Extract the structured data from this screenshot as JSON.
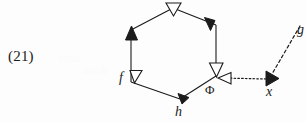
{
  "page": {
    "width": 306,
    "height": 122,
    "background_color": "#fdfdfd",
    "ink_color": "#1b1b1b"
  },
  "equation_number": {
    "text": "(21)"
  },
  "diagram": {
    "type": "commutative-hexagon-diagram",
    "nodes": [
      {
        "id": "f",
        "label": "f",
        "x": 131,
        "y": 82,
        "label_style": "italic"
      },
      {
        "id": "phi",
        "label": "Φ",
        "x": 216,
        "y": 76,
        "label_style": "upright"
      },
      {
        "id": "h",
        "label": "h",
        "x": 180,
        "y": 100,
        "label_style": "italic"
      },
      {
        "id": "x",
        "label": "x",
        "x": 272,
        "y": 80,
        "label_style": "italic"
      },
      {
        "id": "g",
        "label": "g",
        "x": 302,
        "y": 28,
        "label_style": "italic"
      }
    ],
    "hexagon_vertices": [
      {
        "name": "top",
        "x": 173,
        "y": 8
      },
      {
        "name": "upper-right",
        "x": 216,
        "y": 25
      },
      {
        "name": "lower-right",
        "x": 216,
        "y": 76
      },
      {
        "name": "bottom",
        "x": 180,
        "y": 99
      },
      {
        "name": "lower-left",
        "x": 131,
        "y": 82
      },
      {
        "name": "upper-left",
        "x": 131,
        "y": 30
      }
    ],
    "edges": [
      {
        "id": "edge-upperleft-top",
        "from": "upper-left",
        "to": "top",
        "line": "solid",
        "arrowhead": "hollow",
        "arrow_at": "to"
      },
      {
        "id": "edge-top-upperright",
        "from": "top",
        "to": "upper-right",
        "line": "solid",
        "arrowhead": "filled",
        "arrow_at": "to"
      },
      {
        "id": "edge-upperright-lowerright",
        "from": "upper-right",
        "to": "lower-right",
        "line": "solid",
        "arrowhead": "hollow",
        "arrow_at": "to"
      },
      {
        "id": "edge-bottom-lowerright",
        "from": "bottom",
        "to": "lower-right",
        "line": "solid",
        "arrowhead": "none",
        "arrow_at": "none"
      },
      {
        "id": "edge-lowerleft-bottom",
        "from": "lower-left",
        "to": "bottom",
        "line": "solid",
        "arrowhead": "filled",
        "arrow_at": "to"
      },
      {
        "id": "edge-lowerleft-upperleft",
        "from": "lower-left",
        "to": "upper-left",
        "line": "solid",
        "arrowhead": "filled",
        "arrow_at": "to"
      },
      {
        "id": "edge-f-marker",
        "from": "lower-left",
        "to": "lower-left",
        "line": "none",
        "arrowhead": "hollow",
        "arrow_at": "at-node"
      },
      {
        "id": "edge-x-to-phi",
        "from": "x",
        "to": "phi",
        "line": "dotted",
        "arrowhead": "hollow",
        "arrow_at": "to"
      },
      {
        "id": "edge-g-to-x",
        "from": "g",
        "to": "x",
        "line": "dashed",
        "arrowhead": "filled",
        "arrow_at": "to"
      }
    ],
    "arrowhead_styles": {
      "hollow": {
        "fill": "#ffffff",
        "stroke": "#1b1b1b"
      },
      "filled": {
        "fill": "#1b1b1b",
        "stroke": "#1b1b1b"
      }
    }
  },
  "ghost_artifacts": [
    {
      "text": "scan",
      "x": 58,
      "y": 50
    },
    {
      "text": "mark",
      "x": 82,
      "y": 62
    }
  ]
}
